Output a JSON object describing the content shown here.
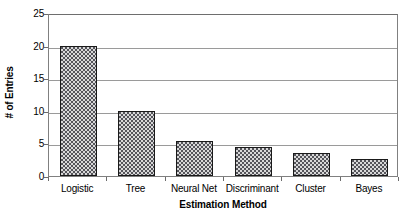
{
  "chart_data": {
    "type": "bar",
    "title": "",
    "xlabel": "Estimation Method",
    "ylabel": "# of Entries",
    "categories": [
      "Logistic",
      "Tree",
      "Neural Net",
      "Discriminant",
      "Cluster",
      "Bayes"
    ],
    "values": [
      20,
      10,
      5.3,
      4.4,
      3.6,
      2.6
    ],
    "ylim": [
      0,
      25
    ],
    "ytick_labels": [
      "0",
      "5",
      "10",
      "15",
      "20",
      "25"
    ],
    "ytick_values": [
      0,
      5,
      10,
      15,
      20,
      25
    ],
    "grid": "horizontal",
    "legend": "none",
    "bar_fill_color": "#54545a",
    "bar_pattern": "checkerboard",
    "bar_border_color": "#1a1a1a",
    "gridline_color": "#9a9a9a",
    "axis_color": "#808080",
    "background_color": "#ffffff"
  }
}
